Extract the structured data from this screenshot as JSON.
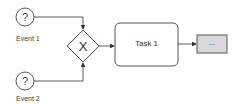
{
  "diagram": {
    "type": "BPMN process",
    "events": [
      {
        "id": "event1",
        "label": "Event 1",
        "symbol": "?"
      },
      {
        "id": "event2",
        "label": "Event 2",
        "symbol": "?"
      }
    ],
    "gateway": {
      "type": "exclusive",
      "symbol": "X"
    },
    "task": {
      "label": "Task 1"
    },
    "collapsed": {
      "label": "..."
    },
    "colors": {
      "stroke": "#555555",
      "collapsed_fill": "#d9d9d9",
      "background": "#ffffff"
    }
  }
}
